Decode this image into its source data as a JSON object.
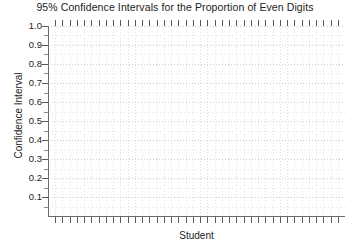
{
  "chart_data": {
    "type": "scatter",
    "title": "95% Confidence Intervals for the Proportion of Even Digits",
    "xlabel": "Student",
    "ylabel": "Confidence Interval",
    "ylim": [
      0.0,
      1.0
    ],
    "ytick_labels": [
      "1.0",
      "0.9",
      "0.8",
      "0.7",
      "0.6",
      "0.5",
      "0.4",
      "0.3",
      "0.2",
      "0.1"
    ],
    "ytick_values": [
      1.0,
      0.9,
      0.8,
      0.7,
      0.6,
      0.5,
      0.4,
      0.3,
      0.2,
      0.1
    ],
    "yminor_step": 0.05,
    "xlim": [
      0,
      40
    ],
    "xtick_count": 40,
    "xtick_labels": [],
    "grid": true,
    "grid_style": "dotted",
    "legend": null,
    "series": [
      {
        "name": "95% Confidence Intervals",
        "values": []
      }
    ],
    "annotations": [],
    "note": "Empty plot frame: axes, ticks and dotted gridlines drawn with no data points or interval bars rendered."
  },
  "colors": {
    "background": "#ffffff",
    "axis": "#6b6b6b",
    "tick": "#5a5a5a",
    "grid_major": "#c9c9c9",
    "grid_minor": "#e2e2e2",
    "text": "#222222"
  }
}
